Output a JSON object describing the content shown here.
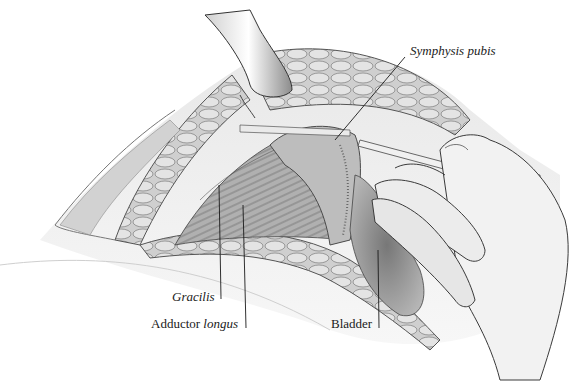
{
  "figure": {
    "type": "anatomical surgical illustration",
    "style": "grayscale pencil drawing"
  },
  "labels": {
    "symphysis": {
      "text": "Symphysis pubis",
      "italic": true
    },
    "gracilis": {
      "text": "Gracilis",
      "italic": true
    },
    "adductor": {
      "normal": "Adductor ",
      "italic": "longus"
    },
    "bladder": {
      "text": "Bladder",
      "italic": false
    }
  },
  "colors": {
    "ink": "#1a1a1a",
    "paper": "#ffffff",
    "tissue_light": "#d9d9d9",
    "tissue_mid": "#a8a8a8",
    "tissue_dark": "#5a5a5a"
  }
}
